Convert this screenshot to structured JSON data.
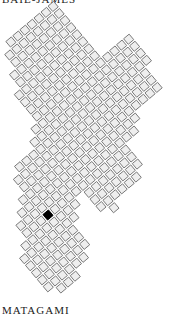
{
  "map": {
    "type": "tile-grid-map",
    "top_label": "BAIE-JAMES",
    "bottom_label": "MATAGAMI",
    "tile_fill": "#eeeeee",
    "tile_stroke": "#777777",
    "selected_fill": "#000000",
    "selected_tile": {
      "description": "single highlighted tile in lower-left section",
      "count": 1
    }
  }
}
